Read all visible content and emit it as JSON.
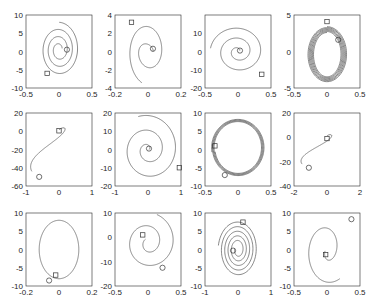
{
  "chart_data": {
    "type": "line",
    "title": "",
    "layout": {
      "rows": 3,
      "cols": 4,
      "grid": false,
      "legend": "none"
    },
    "marker_legend": {
      "circle": "start/end point (circle)",
      "square": "start/end point (square)"
    },
    "subplots": [
      {
        "row": 0,
        "col": 0,
        "xlim": [
          -0.5,
          0.5
        ],
        "ylim": [
          -10,
          10
        ],
        "xticks": [
          "-0.5",
          "0",
          "0.5"
        ],
        "yticks": [
          "10",
          "5",
          "0",
          "-5",
          "-10"
        ],
        "shape": "spiral",
        "center": [
          0,
          0.5
        ],
        "r0": [
          0.05,
          1.2
        ],
        "r1": [
          0.3,
          7.5
        ],
        "turns": 3.2,
        "phase0": 0.3,
        "phase_end_dir": 1,
        "circle": [
          0.12,
          0.5
        ],
        "square": [
          -0.18,
          -6.0
        ]
      },
      {
        "row": 0,
        "col": 1,
        "xlim": [
          -0.2,
          0.2
        ],
        "ylim": [
          -4,
          4
        ],
        "xticks": [
          "-0.2",
          "0",
          "0.2"
        ],
        "yticks": [
          "4",
          "2",
          "0",
          "-2",
          "-4"
        ],
        "shape": "spiral",
        "center": [
          0,
          0
        ],
        "r0": [
          0.03,
          0.3
        ],
        "r1": [
          0.12,
          3.6
        ],
        "turns": 1.7,
        "phase0": 0.0,
        "phase_end_dir": 1,
        "circle": [
          0.03,
          0.3
        ],
        "square": [
          -0.1,
          3.2
        ]
      },
      {
        "row": 0,
        "col": 2,
        "xlim": [
          -0.5,
          0.5
        ],
        "ylim": [
          -20,
          20
        ],
        "xticks": [
          "-0.5",
          "0",
          "0.5"
        ],
        "yticks": [
          "10",
          "0",
          "-10",
          "-20"
        ],
        "shape": "spiral",
        "center": [
          0,
          0
        ],
        "r0": [
          0.03,
          1.0
        ],
        "r1": [
          0.42,
          14
        ],
        "turns": 2.4,
        "phase0": 0.5,
        "phase_end_dir": 1,
        "circle": [
          0.03,
          0.5
        ],
        "square": [
          0.36,
          -12.5
        ]
      },
      {
        "row": 0,
        "col": 3,
        "xlim": [
          -0.5,
          0.5
        ],
        "ylim": [
          -5,
          5
        ],
        "xticks": [
          "-0.5",
          "0",
          "0.5"
        ],
        "yticks": [
          "5",
          "0",
          "-5"
        ],
        "shape": "rings",
        "center": [
          0,
          -0.4
        ],
        "r0": [
          0.2,
          3.0
        ],
        "r1": [
          0.3,
          3.8
        ],
        "turns": 6,
        "phase0": 1.57,
        "phase_end_dir": 1,
        "circle": [
          0.17,
          1.6
        ],
        "square": [
          0.0,
          4.1
        ]
      },
      {
        "row": 1,
        "col": 0,
        "xlim": [
          -1,
          1
        ],
        "ylim": [
          -60,
          20
        ],
        "xticks": [
          "-1",
          "0",
          "1"
        ],
        "yticks": [
          "20",
          "0",
          "-20",
          "-40",
          "-60"
        ],
        "shape": "hook",
        "center": [
          0,
          0
        ],
        "r0": [
          0.1,
          4
        ],
        "r1": [
          0.6,
          50
        ],
        "turns": 0.9,
        "phase0": 0.0,
        "phase_end_dir": 1,
        "circle": [
          -0.6,
          -50
        ],
        "square": [
          0.0,
          0.5
        ]
      },
      {
        "row": 1,
        "col": 1,
        "xlim": [
          -1,
          1
        ],
        "ylim": [
          -20,
          20
        ],
        "xticks": [
          "-1",
          "0",
          "1"
        ],
        "yticks": [
          "20",
          "10",
          "0",
          "-10",
          "-20"
        ],
        "shape": "spiral",
        "center": [
          0,
          0
        ],
        "r0": [
          0.03,
          0.5
        ],
        "r1": [
          0.95,
          19
        ],
        "turns": 2.3,
        "phase0": 0.0,
        "phase_end_dir": 1,
        "circle": [
          0.03,
          0.5
        ],
        "square": [
          0.95,
          -10
        ]
      },
      {
        "row": 1,
        "col": 2,
        "xlim": [
          -0.5,
          0.5
        ],
        "ylim": [
          -10,
          10
        ],
        "xticks": [
          "-0.5",
          "0",
          "0.5"
        ],
        "yticks": [
          "10",
          "5",
          "0",
          "-5",
          "-10"
        ],
        "shape": "rings",
        "center": [
          0,
          0.5
        ],
        "r0": [
          0.35,
          7.0
        ],
        "r1": [
          0.4,
          7.8
        ],
        "turns": 4,
        "phase0": 3.3,
        "phase_end_dir": 1,
        "circle": [
          -0.2,
          -7.0
        ],
        "square": [
          -0.35,
          1.0
        ]
      },
      {
        "row": 1,
        "col": 3,
        "xlim": [
          -2,
          2
        ],
        "ylim": [
          -40,
          20
        ],
        "xticks": [
          "-2",
          "0",
          "2"
        ],
        "yticks": [
          "20",
          "0",
          "-20",
          "-40"
        ],
        "shape": "hook",
        "center": [
          0,
          0
        ],
        "r0": [
          0.1,
          3
        ],
        "r1": [
          1.1,
          25
        ],
        "turns": 0.9,
        "phase0": 0.0,
        "phase_end_dir": 1,
        "circle": [
          -1.1,
          -25
        ],
        "square": [
          0.0,
          -1.0
        ]
      },
      {
        "row": 2,
        "col": 0,
        "xlim": [
          -0.2,
          0.2
        ],
        "ylim": [
          -10,
          10
        ],
        "xticks": [
          "-0.2",
          "0",
          "0.2"
        ],
        "yticks": [
          "10",
          "5",
          "0",
          "-5",
          "-10"
        ],
        "shape": "loop",
        "center": [
          0,
          0
        ],
        "r0": [
          0.12,
          8.0
        ],
        "r1": [
          0.12,
          8.0
        ],
        "turns": 1.0,
        "phase0": -1.3,
        "phase_end_dir": 1,
        "circle": [
          -0.06,
          -8.5
        ],
        "square": [
          -0.02,
          -7.0
        ]
      },
      {
        "row": 2,
        "col": 1,
        "xlim": [
          -0.5,
          0.5
        ],
        "ylim": [
          -20,
          10
        ],
        "xticks": [
          "-0.5",
          "0",
          "0.5"
        ],
        "yticks": [
          "10",
          "0",
          "-10",
          "-20"
        ],
        "shape": "spiral",
        "center": [
          0,
          -2
        ],
        "r0": [
          0.05,
          2
        ],
        "r1": [
          0.42,
          12
        ],
        "turns": 1.8,
        "phase0": 2.5,
        "phase_end_dir": 1,
        "circle": [
          0.22,
          -12.5
        ],
        "square": [
          -0.08,
          1.0
        ]
      },
      {
        "row": 2,
        "col": 2,
        "xlim": [
          -1,
          1
        ],
        "ylim": [
          -10,
          10
        ],
        "xticks": [
          "-1",
          "0",
          "1"
        ],
        "yticks": [
          "10",
          "5",
          "0",
          "-5",
          "-10"
        ],
        "shape": "spiral",
        "center": [
          0,
          0
        ],
        "r0": [
          0.1,
          1.5
        ],
        "r1": [
          0.6,
          7.8
        ],
        "turns": 5,
        "phase0": 3.0,
        "phase_end_dir": 1,
        "circle": [
          -0.15,
          -0.3
        ],
        "square": [
          0.15,
          7.5
        ]
      },
      {
        "row": 2,
        "col": 3,
        "xlim": [
          -0.5,
          0.5
        ],
        "ylim": [
          -10,
          10
        ],
        "xticks": [
          "-0.5",
          "0",
          "0.5"
        ],
        "yticks": [
          "10",
          "5",
          "0",
          "-5",
          "-10"
        ],
        "shape": "spiral",
        "center": [
          0,
          0
        ],
        "r0": [
          0.03,
          1.5
        ],
        "r1": [
          0.36,
          9.5
        ],
        "turns": 1.3,
        "phase0": 3.4,
        "phase_end_dir": 1,
        "circle": [
          0.37,
          8.3
        ],
        "square": [
          -0.02,
          -1.4
        ]
      }
    ]
  }
}
